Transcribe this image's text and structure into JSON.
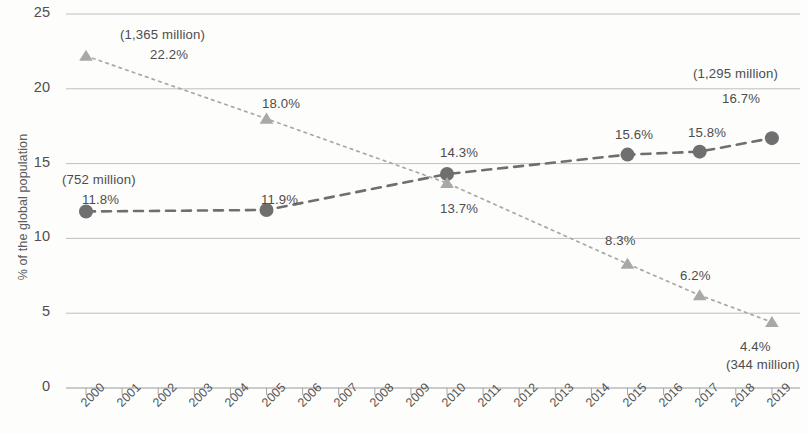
{
  "chart_data": {
    "type": "line",
    "title": "",
    "subtitle": "",
    "xlabel": "",
    "ylabel": "% of the global population",
    "ylim": [
      0,
      25
    ],
    "ytick_labels": [
      "0",
      "5",
      "10",
      "15",
      "20",
      "25"
    ],
    "ytick_values": [
      0,
      5,
      10,
      15,
      20,
      25
    ],
    "grid": true,
    "legend": "none",
    "x": [
      2000,
      2001,
      2002,
      2003,
      2004,
      2005,
      2006,
      2007,
      2008,
      2009,
      2010,
      2011,
      2012,
      2013,
      2014,
      2015,
      2016,
      2017,
      2018,
      2019
    ],
    "xtick_labels": [
      "2000",
      "2001",
      "2002",
      "2003",
      "2004",
      "2005",
      "2006",
      "2007",
      "2008",
      "2009",
      "2010",
      "2011",
      "2012",
      "2013",
      "2014",
      "2015",
      "2016",
      "2017",
      "2018",
      "2019"
    ],
    "series": [
      {
        "name": "circle-series",
        "marker": "circle",
        "line_style": "dashed",
        "color": "#6f6f6f",
        "points": [
          {
            "x": 2000,
            "y": 11.8,
            "label": "11.8%",
            "note": "(752 million)"
          },
          {
            "x": 2005,
            "y": 11.9,
            "label": "11.9%",
            "note": ""
          },
          {
            "x": 2010,
            "y": 14.3,
            "label": "14.3%",
            "note": ""
          },
          {
            "x": 2015,
            "y": 15.6,
            "label": "15.6%",
            "note": ""
          },
          {
            "x": 2017,
            "y": 15.8,
            "label": "15.8%",
            "note": ""
          },
          {
            "x": 2019,
            "y": 16.7,
            "label": "16.7%",
            "note": "(1,295 million)"
          }
        ]
      },
      {
        "name": "triangle-series",
        "marker": "triangle",
        "line_style": "dotted",
        "color": "#a8a8a8",
        "points": [
          {
            "x": 2000,
            "y": 22.2,
            "label": "22.2%",
            "note": "(1,365 million)"
          },
          {
            "x": 2005,
            "y": 18.0,
            "label": "18.0%",
            "note": ""
          },
          {
            "x": 2010,
            "y": 13.7,
            "label": "13.7%",
            "note": ""
          },
          {
            "x": 2015,
            "y": 8.3,
            "label": "8.3%",
            "note": ""
          },
          {
            "x": 2017,
            "y": 6.2,
            "label": "6.2%",
            "note": ""
          },
          {
            "x": 2019,
            "y": 4.4,
            "label": "4.4%",
            "note": "(344 million)"
          }
        ]
      }
    ],
    "annotations": [
      {
        "name": "ann-1365-million",
        "text": "(1,365 million)",
        "x": 120,
        "y": 27,
        "size": "big"
      },
      {
        "name": "ann-22-2-percent",
        "text": "22.2%",
        "x": 150,
        "y": 47,
        "size": "big"
      },
      {
        "name": "ann-18-0-percent",
        "text": "18.0%",
        "x": 262,
        "y": 96,
        "size": "big"
      },
      {
        "name": "ann-752-million",
        "text": "(752 million)",
        "x": 62,
        "y": 172,
        "size": "big"
      },
      {
        "name": "ann-11-8-percent",
        "text": "11.8%",
        "x": 82,
        "y": 192,
        "size": "big"
      },
      {
        "name": "ann-11-9-percent",
        "text": "11.9%",
        "x": 261,
        "y": 192,
        "size": "big"
      },
      {
        "name": "ann-14-3-percent",
        "text": "14.3%",
        "x": 440,
        "y": 145,
        "size": "big"
      },
      {
        "name": "ann-13-7-percent",
        "text": "13.7%",
        "x": 440,
        "y": 201,
        "size": "big"
      },
      {
        "name": "ann-15-6-percent",
        "text": "15.6%",
        "x": 615,
        "y": 127,
        "size": "big"
      },
      {
        "name": "ann-15-8-percent",
        "text": "15.8%",
        "x": 688,
        "y": 125,
        "size": "big"
      },
      {
        "name": "ann-1295-million",
        "text": "(1,295 million)",
        "x": 693,
        "y": 66,
        "size": "big"
      },
      {
        "name": "ann-16-7-percent",
        "text": "16.7%",
        "x": 722,
        "y": 91,
        "size": "big"
      },
      {
        "name": "ann-8-3-percent",
        "text": "8.3%",
        "x": 605,
        "y": 233,
        "size": "big"
      },
      {
        "name": "ann-6-2-percent",
        "text": "6.2%",
        "x": 680,
        "y": 268,
        "size": "big"
      },
      {
        "name": "ann-4-4-percent",
        "text": "4.4%",
        "x": 740,
        "y": 339,
        "size": "big"
      },
      {
        "name": "ann-344-million",
        "text": "(344 million)",
        "x": 726,
        "y": 357,
        "size": "big"
      }
    ]
  },
  "plot": {
    "left": 66,
    "right": 800,
    "top": 14,
    "bottom": 388,
    "x_first_tick": 86,
    "x_tick_spacing": 36.1
  }
}
